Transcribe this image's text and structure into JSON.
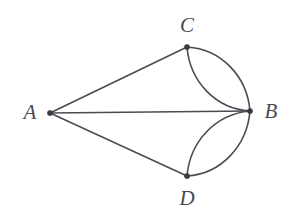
{
  "figure": {
    "background_color": "#ffffff",
    "stroke_color": "#4b4b53",
    "vertex_color": "#3a3a42",
    "width": 296,
    "height": 222
  },
  "graph": {
    "vertices": [
      {
        "id": "A",
        "label": "A",
        "x": 50,
        "y": 113,
        "label_x": 30,
        "label_y": 112
      },
      {
        "id": "B",
        "label": "B",
        "x": 250,
        "y": 111,
        "label_x": 271,
        "label_y": 111
      },
      {
        "id": "C",
        "label": "C",
        "x": 187,
        "y": 47,
        "label_x": 187,
        "label_y": 25
      },
      {
        "id": "D",
        "label": "D",
        "x": 187,
        "y": 176,
        "label_x": 187,
        "label_y": 198
      }
    ],
    "edges": [
      {
        "id": "edge-a-c",
        "from": "A",
        "to": "C",
        "kind": "straight",
        "path": "M 50 113 L 187 47"
      },
      {
        "id": "edge-a-b",
        "from": "A",
        "to": "B",
        "kind": "straight",
        "path": "M 50 113 L 250 111"
      },
      {
        "id": "edge-a-d",
        "from": "A",
        "to": "D",
        "kind": "straight",
        "path": "M 50 113 L 187 176"
      },
      {
        "id": "edge-c-b-outer",
        "from": "C",
        "to": "B",
        "kind": "arc",
        "path": "M 187 47 C 221 49 247 76 250 111"
      },
      {
        "id": "edge-c-b-inner",
        "from": "C",
        "to": "B",
        "kind": "arc",
        "path": "M 187 47 C 190 82 216 109 250 111"
      },
      {
        "id": "edge-d-b-outer",
        "from": "D",
        "to": "B",
        "kind": "arc",
        "path": "M 187 176 C 221 174 247 146 250 111"
      },
      {
        "id": "edge-d-b-inner",
        "from": "D",
        "to": "B",
        "kind": "arc",
        "path": "M 187 176 C 190 141 216 114 250 111"
      }
    ],
    "vertex_radius": 2.6
  }
}
